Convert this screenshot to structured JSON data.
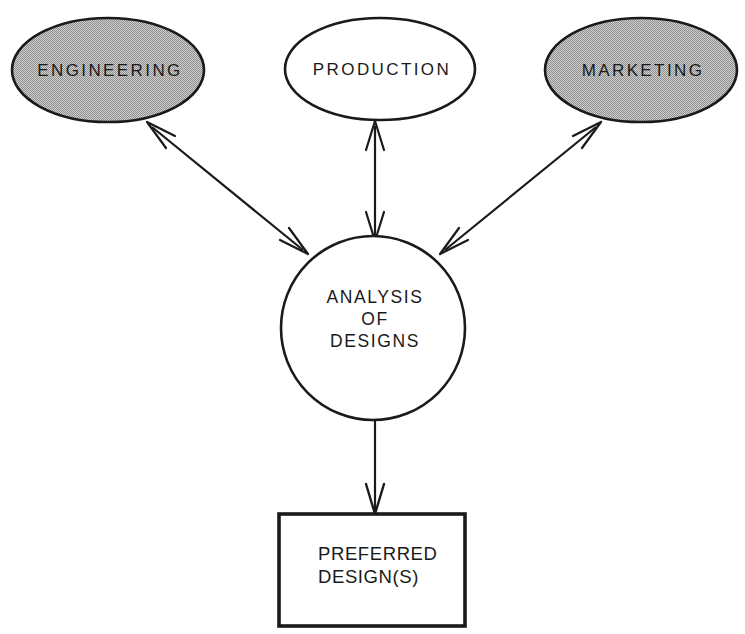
{
  "diagram": {
    "background_color": "#ffffff",
    "stroke_color": "#1a1a1a",
    "shaded_fill_color": "#b8b8b8",
    "unshaded_fill_color": "#ffffff",
    "nodes": {
      "engineering": {
        "label": "ENGINEERING",
        "shape": "ellipse",
        "fill": "shaded"
      },
      "production": {
        "label": "PRODUCTION",
        "shape": "ellipse",
        "fill": "unshaded"
      },
      "marketing": {
        "label": "MARKETING",
        "shape": "ellipse",
        "fill": "shaded"
      },
      "analysis": {
        "shape": "circle",
        "fill": "unshaded",
        "label_lines": [
          "ANALYSIS",
          "OF",
          "DESIGNS"
        ]
      },
      "preferred": {
        "shape": "rectangle",
        "fill": "unshaded",
        "label_lines": [
          "PREFERRED",
          "DESIGN(S)"
        ]
      }
    },
    "edges": [
      {
        "id": "engineering-analysis",
        "from": "analysis",
        "to": "engineering",
        "direction": "bidirectional"
      },
      {
        "id": "production-analysis",
        "from": "analysis",
        "to": "production",
        "direction": "bidirectional"
      },
      {
        "id": "marketing-analysis",
        "from": "analysis",
        "to": "marketing",
        "direction": "bidirectional"
      },
      {
        "id": "analysis-preferred",
        "from": "analysis",
        "to": "preferred",
        "direction": "unidirectional"
      }
    ]
  }
}
